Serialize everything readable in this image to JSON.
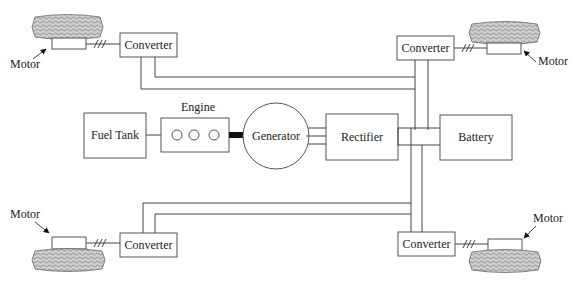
{
  "diagram": {
    "type": "series hybrid electric vehicle powertrain block diagram",
    "blocks": {
      "fuel_tank": "Fuel Tank",
      "engine": "Engine",
      "generator": "Generator",
      "rectifier": "Rectifier",
      "battery": "Battery"
    },
    "converters": {
      "front_left": "Converter",
      "front_right": "Converter",
      "rear_left": "Converter",
      "rear_right": "Converter"
    },
    "motors": {
      "front_left": "Motor",
      "front_right": "Motor",
      "rear_left": "Motor",
      "rear_right": "Motor"
    },
    "engine_cylinders": 3,
    "three_phase_symbol": "///",
    "colors": {
      "line": "#444444",
      "box_border": "#555555",
      "tire_fill": "#9a9a9a",
      "shaft": "#111111"
    }
  }
}
